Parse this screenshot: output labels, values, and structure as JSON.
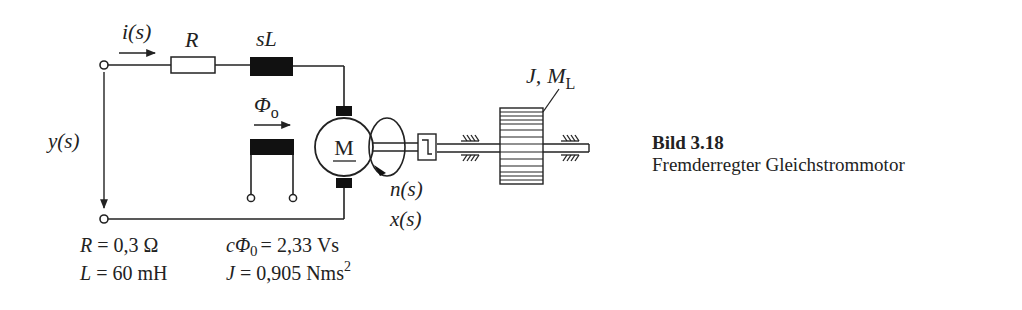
{
  "labels": {
    "current": "i(s)",
    "resistor": "R",
    "inductor": "sL",
    "flux": "Φ",
    "flux_sub": "o",
    "voltage": "y(s)",
    "motor": "M",
    "speed": "n(s)",
    "position": "x(s)",
    "load_J": "J,",
    "load_M": "M",
    "load_M_sub": "L"
  },
  "parameters": {
    "R": {
      "symbol": "R",
      "value": "= 0,3 Ω"
    },
    "L": {
      "symbol": "L",
      "value": "= 60 mH"
    },
    "cPhi": {
      "symbol": "cΦ",
      "sub": "0",
      "value": "= 2,33 Vs"
    },
    "J": {
      "symbol": "J",
      "value": "= 0,905 Nms",
      "sup": "2"
    }
  },
  "caption": {
    "title": "Bild 3.18",
    "text": "Fremderregter Gleichstrommotor"
  },
  "colors": {
    "line": "#222222",
    "fill_dark": "#111111",
    "background": "#ffffff"
  }
}
